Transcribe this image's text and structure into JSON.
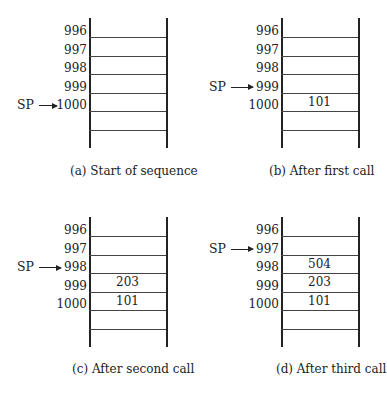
{
  "pointer_label": "SP",
  "addresses": [
    "996",
    "997",
    "998",
    "999",
    "1000"
  ],
  "panels": [
    {
      "id": "a",
      "caption": "(a) Start of sequence",
      "sp_at": "1000",
      "cells": {
        "996": "",
        "997": "",
        "998": "",
        "999": "",
        "1000": ""
      }
    },
    {
      "id": "b",
      "caption": "(b) After first call",
      "sp_at": "999",
      "cells": {
        "996": "",
        "997": "",
        "998": "",
        "999": "101",
        "1000": ""
      }
    },
    {
      "id": "c",
      "caption": "(c) After second call",
      "sp_at": "998",
      "cells": {
        "996": "",
        "997": "",
        "998": "203",
        "999": "101",
        "1000": ""
      }
    },
    {
      "id": "d",
      "caption": "(d) After third call",
      "sp_at": "997",
      "cells": {
        "996": "",
        "997": "504",
        "998": "203",
        "999": "101",
        "1000": ""
      }
    }
  ]
}
